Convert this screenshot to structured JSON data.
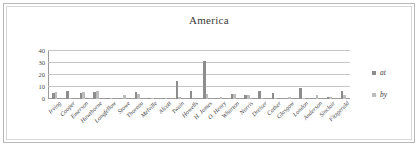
{
  "chart_data": {
    "type": "bar",
    "title": "America",
    "xlabel": "",
    "ylabel": "",
    "ylim": [
      0,
      40
    ],
    "yticks": [
      0,
      10,
      20,
      30,
      40
    ],
    "grid": true,
    "legend_position": "right",
    "categories": [
      "Irving",
      "Cooper",
      "Emerson",
      "Hawthorne",
      "Longfellow",
      "Stowe",
      "Thoreau",
      "Melville",
      "Alcott",
      "Twain",
      "Howells",
      "H. James",
      "O. Henry",
      "Wharton",
      "Norris",
      "Dreiser",
      "Cather",
      "Glasgow",
      "London",
      "Anderson",
      "Sinclair",
      "Fitzgerald"
    ],
    "series": [
      {
        "name": "at",
        "color": "#8d8d8d",
        "values": [
          5,
          7,
          5,
          6,
          0.6,
          0,
          6,
          0.6,
          0.5,
          15,
          7,
          32,
          0,
          4,
          3,
          7,
          5,
          0,
          9,
          0,
          2,
          7
        ]
      },
      {
        "name": "by",
        "color": "#bdbdbd",
        "values": [
          6,
          1,
          6,
          7,
          0.5,
          3,
          4,
          1,
          1,
          2,
          0,
          4,
          2,
          4,
          3,
          1,
          0.5,
          2,
          1,
          3,
          2,
          3
        ]
      }
    ]
  },
  "legend": {
    "items": [
      {
        "label": "at",
        "color": "#8d8d8d"
      },
      {
        "label": "by",
        "color": "#bdbdbd"
      }
    ]
  },
  "colors": {
    "series_at": "#8d8d8d",
    "series_by": "#bdbdbd",
    "gridline": "#c6c6c6",
    "axis": "#9a9a9a",
    "frame": "#b9b9b9"
  }
}
